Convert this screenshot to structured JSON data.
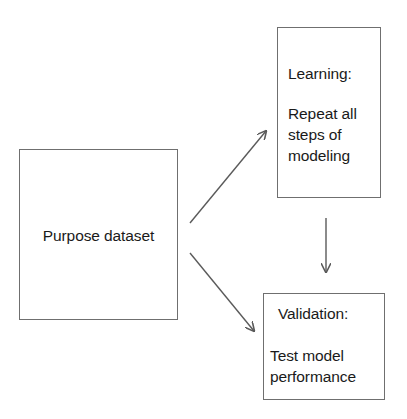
{
  "diagram": {
    "background_color": "#ffffff",
    "stroke_color": "#6f6f6f",
    "arrow_color": "#5a5a5a",
    "text_color": "#1a1a1a",
    "nodes": [
      {
        "id": "purpose",
        "label": "Purpose dataset",
        "shape": "rectangle",
        "x": 19,
        "y": 149,
        "width": 159,
        "height": 171
      },
      {
        "id": "learning",
        "title": "Learning:",
        "body": "Repeat all\nsteps of\nmodeling",
        "shape": "rectangle",
        "x": 277,
        "y": 27,
        "width": 104,
        "height": 171
      },
      {
        "id": "validation",
        "title": "Validation:",
        "body": "Test model\nperformance",
        "shape": "rectangle",
        "x": 263,
        "y": 293,
        "width": 122,
        "height": 107
      }
    ],
    "edges": [
      {
        "id": "purpose-to-learning",
        "from": "purpose",
        "to": "learning",
        "direction": "up-right",
        "arrowhead": "end"
      },
      {
        "id": "purpose-to-validation",
        "from": "purpose",
        "to": "validation",
        "direction": "down-right",
        "arrowhead": "end"
      },
      {
        "id": "learning-to-validation",
        "from": "learning",
        "to": "validation",
        "direction": "down",
        "arrowhead": "end"
      }
    ]
  }
}
